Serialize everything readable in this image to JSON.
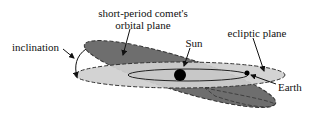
{
  "diagram": {
    "labels": {
      "comet_plane_line1": "short-period comet's",
      "comet_plane_line2": "orbital plane",
      "sun": "Sun",
      "ecliptic": "ecliptic plane",
      "inclination": "inclination",
      "earth": "Earth"
    },
    "colors": {
      "comet_plane": "#6e6e6e",
      "ecliptic_plane": "#cfcfcf",
      "outline": "#333333",
      "sun": "#000000",
      "text": "#111111"
    }
  }
}
